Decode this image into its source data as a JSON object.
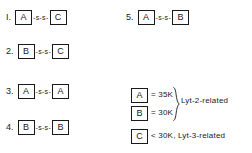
{
  "diagram": {
    "molecules": [
      {
        "index": "I.",
        "left": 6,
        "top": 10,
        "left_subunit": "A",
        "linker": "-s-s-",
        "right_subunit": "C"
      },
      {
        "index": "2.",
        "left": 6,
        "top": 44,
        "left_subunit": "B",
        "linker": "-s-s-",
        "right_subunit": "C"
      },
      {
        "index": "3.",
        "left": 6,
        "top": 84,
        "left_subunit": "A",
        "linker": "-s-s-",
        "right_subunit": "A"
      },
      {
        "index": "4.",
        "left": 6,
        "top": 120,
        "left_subunit": "B",
        "linker": "-s-s-",
        "right_subunit": "B"
      },
      {
        "index": "5.",
        "left": 126,
        "top": 10,
        "left_subunit": "A",
        "linker": "-s-s-",
        "right_subunit": "B"
      }
    ],
    "legend": {
      "grouped_entries": [
        {
          "subunit": "A",
          "value": "= 35K"
        },
        {
          "subunit": "B",
          "value": "= 30K"
        }
      ],
      "group_label": "Lyt-2-related",
      "single_entry": {
        "subunit": "C",
        "value": "< 30K, Lyt-3-related"
      }
    }
  },
  "colors": {
    "ink": "#1a1a1a",
    "background": "#ffffff"
  }
}
